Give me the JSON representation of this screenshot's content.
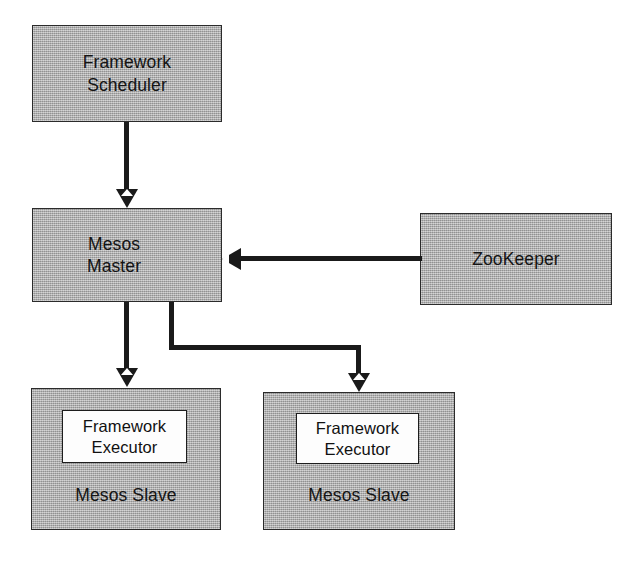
{
  "diagram": {
    "background_color": "#ffffff",
    "node_fill_color": "#b0b0b0",
    "node_border_color": "#2b2b2b",
    "edge_color": "#1a1a1a",
    "executor_fill_color": "#fdfdfd",
    "nodes": {
      "framework_scheduler": {
        "label": "Framework\nScheduler",
        "x": 32,
        "y": 25,
        "w": 190,
        "h": 97
      },
      "mesos_master": {
        "label": "Mesos\nMaster",
        "x": 32,
        "y": 208,
        "w": 190,
        "h": 94
      },
      "zookeeper": {
        "label": "ZooKeeper",
        "x": 420,
        "y": 213,
        "w": 192,
        "h": 92
      },
      "mesos_slave_left": {
        "label": "Mesos Slave",
        "x": 31,
        "y": 388,
        "w": 190,
        "h": 142,
        "executor": {
          "label": "Framework\nExecutor",
          "x": 30,
          "y": 21,
          "w": 125,
          "h": 53
        }
      },
      "mesos_slave_right": {
        "label": "Mesos Slave",
        "x": 263,
        "y": 392,
        "w": 192,
        "h": 138,
        "executor": {
          "label": "Framework\nExecutor",
          "x": 32,
          "y": 20,
          "w": 123,
          "h": 51
        }
      }
    },
    "edges": [
      {
        "name": "scheduler-to-master",
        "from": "framework_scheduler",
        "to": "mesos_master",
        "kind": "vertical-down",
        "direction": "down"
      },
      {
        "name": "zookeeper-to-master",
        "from": "zookeeper",
        "to": "mesos_master",
        "kind": "horizontal-left",
        "direction": "left"
      },
      {
        "name": "master-to-slave-left",
        "from": "mesos_master",
        "to": "mesos_slave_left",
        "kind": "vertical-down",
        "direction": "down"
      },
      {
        "name": "master-to-slave-right",
        "from": "mesos_master",
        "to": "mesos_slave_right",
        "kind": "elbow-down-right-down",
        "direction": "down"
      }
    ]
  }
}
